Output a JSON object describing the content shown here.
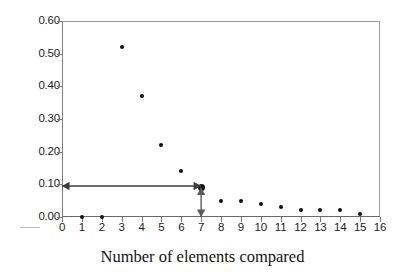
{
  "chart_data": {
    "type": "scatter",
    "title": "",
    "xlabel": "Number of elements compared",
    "ylabel": "",
    "xlim": [
      0,
      16
    ],
    "ylim": [
      0.0,
      0.6
    ],
    "grid": false,
    "legend": false,
    "x_ticks": [
      "0",
      "1",
      "2",
      "3",
      "4",
      "5",
      "6",
      "7",
      "8",
      "9",
      "10",
      "11",
      "12",
      "13",
      "14",
      "15",
      "16"
    ],
    "y_ticks": [
      "0.00",
      "0.10",
      "0.20",
      "0.30",
      "0.40",
      "0.50",
      "0.60"
    ],
    "x": [
      1,
      2,
      3,
      4,
      5,
      6,
      7,
      8,
      9,
      10,
      11,
      12,
      13,
      14,
      15
    ],
    "values": [
      0.0,
      0.0,
      0.52,
      0.37,
      0.22,
      0.14,
      0.09,
      0.05,
      0.05,
      0.04,
      0.03,
      0.02,
      0.02,
      0.02,
      0.01
    ],
    "series": [
      {
        "name": "",
        "marker": "dot",
        "color": "#101010",
        "points": [
          {
            "x": 1,
            "y": 0.0
          },
          {
            "x": 2,
            "y": 0.0
          },
          {
            "x": 3,
            "y": 0.52
          },
          {
            "x": 4,
            "y": 0.37
          },
          {
            "x": 5,
            "y": 0.22
          },
          {
            "x": 6,
            "y": 0.14
          },
          {
            "x": 7,
            "y": 0.09
          },
          {
            "x": 8,
            "y": 0.05
          },
          {
            "x": 9,
            "y": 0.05
          },
          {
            "x": 10,
            "y": 0.04
          },
          {
            "x": 11,
            "y": 0.03
          },
          {
            "x": 12,
            "y": 0.02
          },
          {
            "x": 13,
            "y": 0.02
          },
          {
            "x": 14,
            "y": 0.02
          },
          {
            "x": 15,
            "y": 0.01
          }
        ]
      }
    ],
    "annotations": [
      {
        "name": "horizontal-double-arrow",
        "type": "double-arrow",
        "orientation": "horizontal",
        "from": {
          "x": 0,
          "y": 0.095
        },
        "to": {
          "x": 7,
          "y": 0.095
        },
        "color": "#3c3c3c"
      },
      {
        "name": "vertical-double-arrow",
        "type": "double-arrow",
        "orientation": "vertical",
        "from": {
          "x": 7,
          "y": 0.09
        },
        "to": {
          "x": 7,
          "y": 0.0
        },
        "color": "#5a5a5a"
      }
    ],
    "highlighted_point": {
      "x": 7,
      "y": 0.09
    }
  },
  "axis": {
    "x_title": "Number of elements compared"
  }
}
